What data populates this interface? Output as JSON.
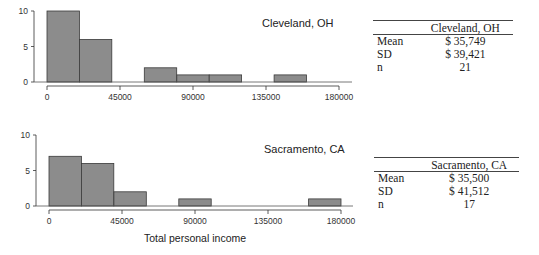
{
  "chart_data": [
    {
      "type": "bar",
      "title": "Cleveland, OH",
      "xlabel": "",
      "ylabel": "",
      "bin_width": 20000,
      "bin_edges": [
        0,
        20000,
        40000,
        60000,
        80000,
        100000,
        120000,
        140000,
        160000
      ],
      "categories": [
        "0-20000",
        "20000-40000",
        "40000-60000",
        "60000-80000",
        "80000-100000",
        "100000-120000",
        "120000-140000",
        "140000-160000"
      ],
      "values": [
        10,
        6,
        0,
        2,
        1,
        1,
        0,
        1
      ],
      "xticks": [
        0,
        45000,
        90000,
        135000,
        180000
      ],
      "yticks": [
        0,
        5,
        10
      ],
      "xlim": [
        0,
        180000
      ],
      "ylim": [
        0,
        10
      ],
      "grid": false,
      "bar_color": "#8c8c8c"
    },
    {
      "type": "bar",
      "title": "Sacramento, CA",
      "xlabel": "Total personal income",
      "ylabel": "",
      "bin_width": 20000,
      "bin_edges": [
        0,
        20000,
        40000,
        60000,
        80000,
        100000,
        120000,
        140000,
        160000,
        180000
      ],
      "categories": [
        "0-20000",
        "20000-40000",
        "40000-60000",
        "60000-80000",
        "80000-100000",
        "100000-120000",
        "120000-140000",
        "140000-160000",
        "160000-180000"
      ],
      "values": [
        7,
        6,
        2,
        0,
        1,
        0,
        0,
        0,
        1
      ],
      "xticks": [
        0,
        45000,
        90000,
        135000,
        180000
      ],
      "yticks": [
        0,
        5,
        10
      ],
      "xlim": [
        0,
        180000
      ],
      "ylim": [
        0,
        10
      ],
      "grid": false,
      "bar_color": "#8c8c8c"
    }
  ],
  "charts": {
    "top": {
      "city_label": "Cleveland, OH",
      "xtick_labels": [
        "0",
        "45000",
        "90000",
        "135000",
        "180000"
      ],
      "ytick_labels": [
        "0",
        "5",
        "10"
      ]
    },
    "bottom": {
      "city_label": "Sacramento, CA",
      "xtick_labels": [
        "0",
        "45000",
        "90000",
        "135000",
        "180000"
      ],
      "ytick_labels": [
        "0",
        "5",
        "10"
      ],
      "xlabel": "Total personal income"
    }
  },
  "tables": {
    "cleveland": {
      "header": "Cleveland, OH",
      "rows": [
        {
          "label": "Mean",
          "value": "$ 35,749"
        },
        {
          "label": "SD",
          "value": "$ 39,421"
        },
        {
          "label": "n",
          "value": "21"
        }
      ]
    },
    "sacramento": {
      "header": "Sacramento, CA",
      "rows": [
        {
          "label": "Mean",
          "value": "$ 35,500"
        },
        {
          "label": "SD",
          "value": "$ 41,512"
        },
        {
          "label": "n",
          "value": "17"
        }
      ]
    }
  }
}
